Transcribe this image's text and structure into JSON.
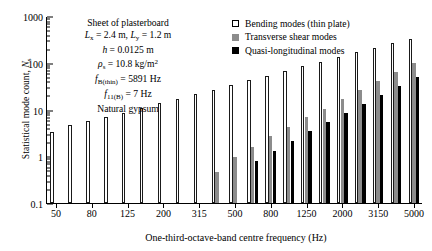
{
  "chart_data": {
    "type": "bar",
    "title": "",
    "xlabel": "One-third-octave-band centre frequency (Hz)",
    "ylabel": "Statistical mode count, N_s",
    "ylim": [
      0.1,
      1000
    ],
    "yscale": "log",
    "xscale": "log-banded",
    "grid": false,
    "legend_position": "top-right",
    "ytick_labels": [
      "1000",
      "100",
      "10",
      "1",
      "0.1"
    ],
    "ytick_values": [
      1000,
      100,
      10,
      1,
      0.1
    ],
    "xtick_labels": [
      "50",
      "80",
      "125",
      "200",
      "315",
      "500",
      "800",
      "1250",
      "2000",
      "3150",
      "5000"
    ],
    "categories": [
      50,
      63,
      80,
      100,
      125,
      160,
      200,
      250,
      315,
      400,
      500,
      630,
      800,
      1000,
      1250,
      1600,
      2000,
      2500,
      3150,
      4000,
      5000
    ],
    "series": [
      {
        "name": "Bending modes (thin plate)",
        "key": "bending",
        "color": "#ffffff",
        "edge": "#1a1a1a",
        "values": [
          3.3,
          4.6,
          5.6,
          7.0,
          8.6,
          11.0,
          13.5,
          17.0,
          21.5,
          26.5,
          33.0,
          42.0,
          53.0,
          67.0,
          84.0,
          105.0,
          132.0,
          167.0,
          210.0,
          265.0,
          330.0
        ]
      },
      {
        "name": "Transverse shear modes",
        "key": "shear",
        "color": "#8c8c8c",
        "values": [
          null,
          null,
          null,
          null,
          null,
          null,
          null,
          null,
          null,
          0.45,
          0.95,
          1.6,
          2.7,
          4.3,
          6.8,
          10.5,
          16.5,
          26.0,
          41.0,
          64.0,
          100.0
        ]
      },
      {
        "name": "Quasi-longitudinal modes",
        "key": "quasi",
        "color": "#000000",
        "values": [
          null,
          null,
          null,
          null,
          null,
          null,
          null,
          null,
          null,
          null,
          null,
          0.78,
          1.3,
          2.1,
          3.4,
          5.3,
          8.3,
          13.0,
          20.5,
          32.0,
          50.0
        ]
      }
    ]
  },
  "annotation": {
    "lines": [
      {
        "parts": [
          {
            "t": "Sheet of plasterboard",
            "s": "n"
          }
        ]
      },
      {
        "parts": [
          {
            "t": "L",
            "s": "i"
          },
          {
            "t": "x",
            "s": "sub"
          },
          {
            "t": " = 2.4 m, ",
            "s": "n"
          },
          {
            "t": "L",
            "s": "i"
          },
          {
            "t": "y",
            "s": "sub"
          },
          {
            "t": " = 1.2 m",
            "s": "n"
          }
        ]
      },
      {
        "parts": [
          {
            "t": "h",
            "s": "i"
          },
          {
            "t": " = 0.0125 m",
            "s": "n"
          }
        ]
      },
      {
        "parts": [
          {
            "t": "ρ",
            "s": "i"
          },
          {
            "t": "s",
            "s": "sub"
          },
          {
            "t": " = 10.8 kg/m",
            "s": "n"
          },
          {
            "t": "2",
            "s": "sup"
          }
        ]
      },
      {
        "parts": [
          {
            "t": "f",
            "s": "i"
          },
          {
            "t": "B(thin)",
            "s": "sub"
          },
          {
            "t": " = 5891 Hz",
            "s": "n"
          }
        ]
      },
      {
        "parts": [
          {
            "t": "f",
            "s": "i"
          },
          {
            "t": "11(B)",
            "s": "sub"
          },
          {
            "t": " = 7 Hz",
            "s": "n"
          }
        ]
      },
      {
        "parts": [
          {
            "t": "Natural gypsum",
            "s": "n"
          }
        ]
      }
    ]
  },
  "legend": {
    "items": [
      {
        "label": "Bending modes (thin plate)",
        "key": "bending"
      },
      {
        "label": "Transverse shear modes",
        "key": "shear"
      },
      {
        "label": "Quasi-longitudinal modes",
        "key": "quasi"
      }
    ]
  },
  "axis": {
    "y_title_main": "Statistical mode count, ",
    "y_title_italic": "N",
    "y_title_sub": "s",
    "x_title": "One-third-octave-band centre frequency (Hz)"
  }
}
